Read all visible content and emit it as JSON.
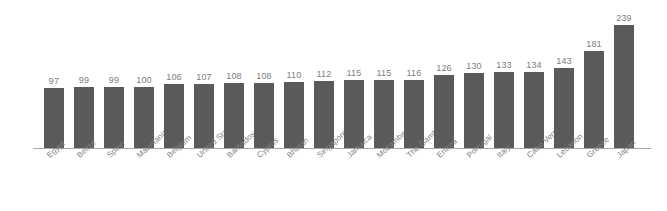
{
  "chart_data": {
    "type": "bar",
    "title": "",
    "subtitle": "",
    "xlabel": "",
    "ylabel": "",
    "grid": false,
    "legend": false,
    "orientation": "vertical",
    "bar_color": "#5a5a5a",
    "label_color": "#7d7d7d",
    "axis_color": "#a8a8a8",
    "background": "#ffffff",
    "value_labels_shown": true,
    "axis_tick_labels": [],
    "ylim": [
      0,
      250
    ],
    "categories": [
      "Egypt",
      "Belize",
      "Spain",
      "Mauritania",
      "Belgium",
      "United States",
      "Barbados",
      "Cyprus",
      "Bhutan",
      "Singapore",
      "Jamaica",
      "Mozambique",
      "The Gambia",
      "Eritrea",
      "Portugal",
      "Italy",
      "Cabo Verde",
      "Lebanon",
      "Greece",
      "Japan"
    ],
    "values": [
      97,
      99,
      99,
      100,
      106,
      107,
      108,
      108,
      110,
      112,
      115,
      115,
      116,
      126,
      130,
      133,
      134,
      143,
      181,
      239
    ]
  }
}
